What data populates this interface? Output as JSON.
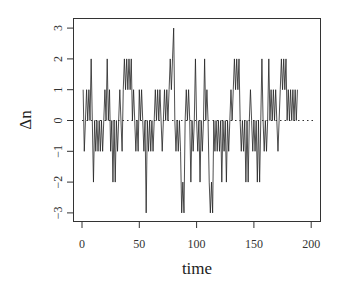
{
  "chart_data": {
    "type": "line",
    "title": "",
    "xlabel": "time",
    "ylabel": "Δn",
    "xlim": [
      -5,
      207
    ],
    "ylim": [
      -3.25,
      3.25
    ],
    "xticks": [
      0,
      50,
      100,
      150,
      200
    ],
    "yticks": [
      -3,
      -2,
      -1,
      0,
      1,
      2,
      3
    ],
    "grid": false,
    "legend": null,
    "reference_line": {
      "y": 0,
      "style": "dotted"
    },
    "series": [
      {
        "name": "Δn",
        "x_start": 1,
        "x_step": 1,
        "values": [
          1,
          -1,
          0,
          1,
          0,
          1,
          0,
          2,
          0,
          -2,
          0,
          -1,
          0,
          -1,
          0,
          -1,
          0,
          -1,
          0,
          1,
          0,
          2,
          0,
          1,
          -1,
          0,
          -2,
          0,
          -2,
          0,
          -1,
          0,
          1,
          0,
          -1,
          1,
          2,
          1,
          2,
          1,
          2,
          1,
          2,
          0,
          1,
          0,
          -1,
          0,
          -1,
          1,
          0,
          1,
          0,
          -1,
          0,
          -3,
          0,
          -1,
          0,
          -1,
          0,
          -1,
          0,
          1,
          0,
          1,
          0,
          1,
          0,
          -1,
          0,
          1,
          0,
          1,
          0,
          1,
          2,
          1,
          2,
          3,
          0,
          -1,
          0,
          -1,
          0,
          -1,
          -3,
          -2,
          -3,
          0,
          1,
          0,
          1,
          0,
          -2,
          0,
          -1,
          0,
          2,
          0,
          -1,
          0,
          -2,
          0,
          -1,
          0,
          2,
          0,
          1,
          0,
          -2,
          -3,
          -2,
          -3,
          0,
          -1,
          0,
          -1,
          0,
          -1,
          0,
          -2,
          0,
          -1,
          0,
          -2,
          0,
          -1,
          0,
          1,
          0,
          1,
          2,
          1,
          2,
          1,
          2,
          0,
          -1,
          0,
          -1,
          0,
          -2,
          0,
          -2,
          0,
          1,
          0,
          -1,
          0,
          -1,
          0,
          -2,
          0,
          -2,
          0,
          2,
          0,
          -1,
          0,
          -1,
          0,
          2,
          0,
          1,
          0,
          1,
          0,
          1,
          0,
          -1,
          0,
          1,
          2,
          1,
          2,
          1,
          2,
          0,
          1,
          0,
          1,
          0,
          1,
          0,
          1,
          0,
          1
        ]
      }
    ]
  }
}
